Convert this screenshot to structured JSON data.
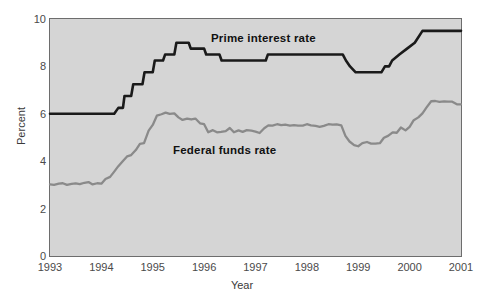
{
  "chart_data": {
    "type": "line",
    "title": "",
    "xlabel": "Year",
    "ylabel": "Percent",
    "xlim": [
      1993,
      2001
    ],
    "ylim": [
      0,
      10
    ],
    "grid": false,
    "legend_position": "inline-annotations",
    "xticks": [
      "1993",
      "1994",
      "1995",
      "1996",
      "1997",
      "1998",
      "1999",
      "2000",
      "2001"
    ],
    "yticks": [
      "0",
      "2",
      "4",
      "6",
      "8",
      "10"
    ],
    "annotations": [
      {
        "text": "Prime interest rate",
        "x": 1996.0,
        "y": 9.2
      },
      {
        "text": "Federal funds rate",
        "x": 1995.5,
        "y": 4.6
      }
    ],
    "colors": {
      "plot_background": "#d5d5d5",
      "frame": "#6d6d6d",
      "prime_line": "#1a1a1a",
      "federal_funds_line": "#8a8a8a",
      "tick_text": "#4a4a4a"
    },
    "series": [
      {
        "name": "Prime interest rate",
        "color": "#1a1a1a",
        "width": 2.6,
        "points": [
          [
            1993.0,
            6.0
          ],
          [
            1994.25,
            6.0
          ],
          [
            1994.33,
            6.25
          ],
          [
            1994.42,
            6.25
          ],
          [
            1994.45,
            6.75
          ],
          [
            1994.58,
            6.75
          ],
          [
            1994.62,
            7.25
          ],
          [
            1994.8,
            7.25
          ],
          [
            1994.84,
            7.75
          ],
          [
            1995.0,
            7.75
          ],
          [
            1995.04,
            8.25
          ],
          [
            1995.2,
            8.25
          ],
          [
            1995.24,
            8.5
          ],
          [
            1995.42,
            8.5
          ],
          [
            1995.46,
            9.0
          ],
          [
            1995.7,
            9.0
          ],
          [
            1995.74,
            8.75
          ],
          [
            1996.0,
            8.75
          ],
          [
            1996.04,
            8.5
          ],
          [
            1996.3,
            8.5
          ],
          [
            1996.34,
            8.25
          ],
          [
            1997.2,
            8.25
          ],
          [
            1997.24,
            8.5
          ],
          [
            1998.7,
            8.5
          ],
          [
            1998.76,
            8.25
          ],
          [
            1998.84,
            8.0
          ],
          [
            1998.95,
            7.75
          ],
          [
            1999.45,
            7.75
          ],
          [
            1999.52,
            8.0
          ],
          [
            1999.6,
            8.0
          ],
          [
            1999.66,
            8.25
          ],
          [
            1999.8,
            8.5
          ],
          [
            1999.95,
            8.75
          ],
          [
            2000.1,
            9.0
          ],
          [
            2000.25,
            9.5
          ],
          [
            2000.4,
            9.5
          ],
          [
            2001.0,
            9.5
          ]
        ]
      },
      {
        "name": "Federal funds rate",
        "color": "#8a8a8a",
        "width": 2.3,
        "points": [
          [
            1993.0,
            3.02
          ],
          [
            1993.08,
            3.0
          ],
          [
            1993.17,
            3.05
          ],
          [
            1993.25,
            3.07
          ],
          [
            1993.33,
            3.0
          ],
          [
            1993.42,
            3.04
          ],
          [
            1993.5,
            3.06
          ],
          [
            1993.58,
            3.03
          ],
          [
            1993.67,
            3.09
          ],
          [
            1993.75,
            3.12
          ],
          [
            1993.83,
            3.02
          ],
          [
            1993.92,
            3.07
          ],
          [
            1994.0,
            3.05
          ],
          [
            1994.08,
            3.25
          ],
          [
            1994.17,
            3.34
          ],
          [
            1994.25,
            3.56
          ],
          [
            1994.33,
            3.79
          ],
          [
            1994.42,
            4.01
          ],
          [
            1994.5,
            4.2
          ],
          [
            1994.58,
            4.26
          ],
          [
            1994.67,
            4.47
          ],
          [
            1994.75,
            4.73
          ],
          [
            1994.83,
            4.76
          ],
          [
            1994.92,
            5.29
          ],
          [
            1995.0,
            5.53
          ],
          [
            1995.08,
            5.92
          ],
          [
            1995.17,
            5.98
          ],
          [
            1995.25,
            6.05
          ],
          [
            1995.33,
            6.0
          ],
          [
            1995.42,
            6.02
          ],
          [
            1995.5,
            5.85
          ],
          [
            1995.58,
            5.74
          ],
          [
            1995.67,
            5.8
          ],
          [
            1995.75,
            5.76
          ],
          [
            1995.83,
            5.8
          ],
          [
            1995.92,
            5.6
          ],
          [
            1996.0,
            5.56
          ],
          [
            1996.08,
            5.22
          ],
          [
            1996.17,
            5.31
          ],
          [
            1996.25,
            5.22
          ],
          [
            1996.33,
            5.24
          ],
          [
            1996.42,
            5.27
          ],
          [
            1996.5,
            5.4
          ],
          [
            1996.58,
            5.22
          ],
          [
            1996.67,
            5.3
          ],
          [
            1996.75,
            5.24
          ],
          [
            1996.83,
            5.31
          ],
          [
            1996.92,
            5.29
          ],
          [
            1997.0,
            5.25
          ],
          [
            1997.08,
            5.19
          ],
          [
            1997.17,
            5.39
          ],
          [
            1997.25,
            5.51
          ],
          [
            1997.33,
            5.5
          ],
          [
            1997.42,
            5.56
          ],
          [
            1997.5,
            5.52
          ],
          [
            1997.58,
            5.54
          ],
          [
            1997.67,
            5.5
          ],
          [
            1997.75,
            5.52
          ],
          [
            1997.83,
            5.5
          ],
          [
            1997.92,
            5.5
          ],
          [
            1998.0,
            5.56
          ],
          [
            1998.08,
            5.51
          ],
          [
            1998.17,
            5.49
          ],
          [
            1998.25,
            5.45
          ],
          [
            1998.33,
            5.49
          ],
          [
            1998.42,
            5.56
          ],
          [
            1998.5,
            5.54
          ],
          [
            1998.58,
            5.55
          ],
          [
            1998.67,
            5.51
          ],
          [
            1998.75,
            5.07
          ],
          [
            1998.83,
            4.83
          ],
          [
            1998.92,
            4.68
          ],
          [
            1999.0,
            4.63
          ],
          [
            1999.08,
            4.76
          ],
          [
            1999.17,
            4.81
          ],
          [
            1999.25,
            4.74
          ],
          [
            1999.33,
            4.74
          ],
          [
            1999.42,
            4.76
          ],
          [
            1999.5,
            4.99
          ],
          [
            1999.58,
            5.07
          ],
          [
            1999.67,
            5.22
          ],
          [
            1999.75,
            5.2
          ],
          [
            1999.83,
            5.42
          ],
          [
            1999.92,
            5.3
          ],
          [
            2000.0,
            5.45
          ],
          [
            2000.08,
            5.73
          ],
          [
            2000.17,
            5.85
          ],
          [
            2000.25,
            6.02
          ],
          [
            2000.33,
            6.27
          ],
          [
            2000.42,
            6.53
          ],
          [
            2000.5,
            6.54
          ],
          [
            2000.58,
            6.5
          ],
          [
            2000.67,
            6.52
          ],
          [
            2000.75,
            6.51
          ],
          [
            2000.83,
            6.51
          ],
          [
            2000.92,
            6.4
          ],
          [
            2001.0,
            6.4
          ]
        ]
      }
    ]
  },
  "axes": {
    "ylabel": "Percent",
    "xlabel": "Year",
    "yticks": [
      "10",
      "8",
      "6",
      "4",
      "2",
      "0"
    ],
    "xticks": [
      "1993",
      "1994",
      "1995",
      "1996",
      "1997",
      "1998",
      "1999",
      "2000",
      "2001"
    ]
  },
  "labels": {
    "prime": "Prime interest rate",
    "federal_funds": "Federal funds rate"
  }
}
